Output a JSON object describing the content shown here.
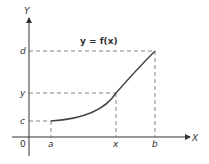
{
  "diagram": {
    "title": "y = f(x)",
    "axes": {
      "x_label": "X",
      "y_label": "Y",
      "origin_label": "0"
    },
    "x_ticks": [
      "a",
      "x",
      "b"
    ],
    "y_ticks": [
      "c",
      "y",
      "d"
    ],
    "curve": "increasing convex curve from (a, c) through (x, y) to (b, d)",
    "colors": {
      "curve": "#444444",
      "axes": "#333333",
      "dashed": "#555555"
    }
  }
}
